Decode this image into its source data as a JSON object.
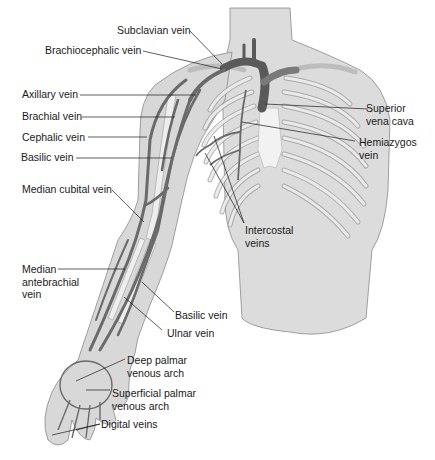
{
  "figure": {
    "colors": {
      "skin": "#dcdcdc",
      "skin_outline": "#8a8a8a",
      "bone": "#eeeeee",
      "bone_outline": "#9a9a9a",
      "vein": "#6f6f6f",
      "vein_dark": "#5a5a5a",
      "leader": "#1a1a1a"
    }
  },
  "labels": {
    "subclavian": "Subclavian vein",
    "brachiocephalic": "Brachiocephalic vein",
    "axillary": "Axillary vein",
    "brachial": "Brachial vein",
    "cephalic": "Cephalic vein",
    "basilic_upper": "Basilic vein",
    "median_cubital": "Median cubital vein",
    "median_antebrachial": "Median\nantebrachial\nvein",
    "basilic_lower": "Basilic vein",
    "ulnar": "Ulnar vein",
    "deep_palmar": "Deep palmar\nvenous arch",
    "superficial_palmar": "Superficial palmar\nvenous arch",
    "digital": "Digital veins",
    "svc": "Superior\nvena cava",
    "hemiazygos": "Hemiazygos\nvein",
    "intercostal": "Intercostal\nveins"
  }
}
